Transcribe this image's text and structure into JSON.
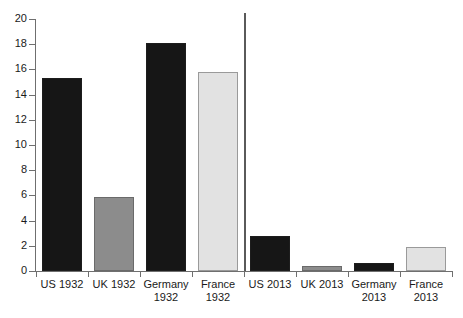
{
  "chart_data": {
    "type": "bar",
    "title": "",
    "subtitle": "",
    "xlabel": "",
    "ylabel": "",
    "ylim": [
      0,
      20
    ],
    "ytick_step": 2,
    "yticks": [
      0,
      2,
      4,
      6,
      8,
      10,
      12,
      14,
      16,
      18,
      20
    ],
    "grid": false,
    "legend": null,
    "categories": [
      "US 1932",
      "UK 1932",
      "Germany\n1932",
      "France\n1932",
      "US 2013",
      "UK 2013",
      "Germany\n2013",
      "France\n2013"
    ],
    "values": [
      15.3,
      5.9,
      18.1,
      15.8,
      2.8,
      0.4,
      0.6,
      1.9
    ],
    "bar_styles": [
      "dark",
      "mid",
      "dark",
      "light",
      "dark",
      "mid",
      "dark",
      "light"
    ],
    "annotations": [
      {
        "name": "era-divider",
        "type": "vertical-line",
        "after_category_index": 3,
        "color": "#5a5a5a"
      }
    ],
    "colors": {
      "dark": "#161616",
      "mid": "#8c8c8c",
      "light": "#e2e2e2",
      "axis": "#6f6f6f",
      "divider": "#5a5a5a",
      "text": "#1a1a1a",
      "background": "#ffffff"
    }
  }
}
